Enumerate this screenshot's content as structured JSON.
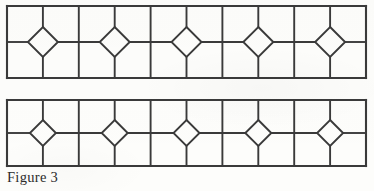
{
  "figure": {
    "caption": "Figure 3",
    "background_color": "#fdfdfb",
    "line_color": "#3a3a3a",
    "panel_count": 2
  },
  "panels": [
    {
      "id": "top-panel",
      "name": "upper-lattice-panel",
      "x": 7,
      "y": 6,
      "width": 359,
      "height": 72,
      "rows": 2,
      "columns": 10,
      "column_x_positions": [
        7,
        42.9,
        78.8,
        114.7,
        150.6,
        186.5,
        222.4,
        258.3,
        294.2,
        330.1,
        366
      ],
      "midline_y": 42,
      "diamond_count": 5,
      "diamond_centers_x": [
        42.9,
        114.7,
        186.5,
        258.3,
        330.1
      ],
      "diamond_half_width": 15,
      "diamond_half_height": 15,
      "stroke_width": 1.9
    },
    {
      "id": "bottom-panel",
      "name": "lower-lattice-panel",
      "x": 7,
      "y": 100,
      "width": 359,
      "height": 66,
      "rows": 2,
      "columns": 10,
      "column_x_positions": [
        7,
        42.9,
        78.8,
        114.7,
        150.6,
        186.5,
        222.4,
        258.3,
        294.2,
        330.1,
        366
      ],
      "midline_y": 133,
      "diamond_count": 5,
      "diamond_centers_x": [
        42.9,
        114.7,
        186.5,
        258.3,
        330.1
      ],
      "diamond_half_width": 13,
      "diamond_half_height": 13,
      "stroke_width": 1.9
    }
  ]
}
